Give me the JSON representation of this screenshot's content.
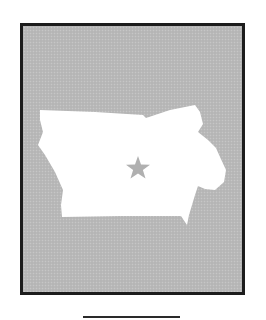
{
  "figure": {
    "colors": {
      "page_background": "#ffffff",
      "frame_border": "#1c1c1c",
      "frame_fill": "#b9b9b9",
      "state_fill": "#ffffff",
      "star_fill": "#b0b0b0",
      "underline": "#2a2a2a"
    },
    "elements": {
      "frame": "gray-framed-panel",
      "state_shape": "state-silhouette",
      "capital_marker": "star-icon",
      "caption_line": "blank-answer-line"
    }
  }
}
